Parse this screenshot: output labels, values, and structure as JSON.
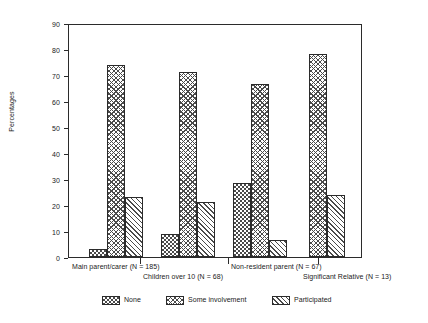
{
  "chart_data": {
    "type": "bar",
    "title": "",
    "xlabel": "",
    "ylabel": "Percentages",
    "ylim": [
      0,
      90
    ],
    "ytick_step": 10,
    "yticks": [
      0,
      10,
      20,
      30,
      40,
      50,
      60,
      70,
      80,
      90
    ],
    "grid": false,
    "legend_position": "bottom",
    "categories": [
      "Main parent/carer (N = 185)",
      "Children over 10 (N = 68)",
      "Non-resident parent (N = 67)",
      "Significant Relative (N = 13)"
    ],
    "series": [
      {
        "name": "None",
        "pattern": "checkerboard",
        "values": [
          3,
          9,
          28.5,
          null
        ]
      },
      {
        "name": "Some involvement",
        "pattern": "herringbone",
        "values": [
          74,
          71,
          66.5,
          78
        ]
      },
      {
        "name": "Participated",
        "pattern": "diagonal-hatch",
        "values": [
          23,
          21,
          6.5,
          24
        ]
      }
    ]
  },
  "axis": {
    "y_title": "Percentages",
    "y_labels": [
      "90",
      "80",
      "70",
      "60",
      "50",
      "40",
      "30",
      "20",
      "10",
      "0"
    ]
  },
  "x_labels": [
    {
      "text": "Main parent/carer (N = 185)",
      "row": 0
    },
    {
      "text": "Children over 10 (N = 68)",
      "row": 1
    },
    {
      "text": "Non-resident parent (N = 67)",
      "row": 0
    },
    {
      "text": "Significant Relative (N = 13)",
      "row": 1
    }
  ],
  "legend": {
    "items": [
      {
        "label": "None",
        "pattern": "checkerboard"
      },
      {
        "label": "Some involvement",
        "pattern": "herringbone"
      },
      {
        "label": "Participated",
        "pattern": "diagonal-hatch"
      }
    ]
  },
  "colors": {
    "ink": "#2b2b2b",
    "hatch": "#4a4a4a",
    "background": "#ffffff"
  }
}
